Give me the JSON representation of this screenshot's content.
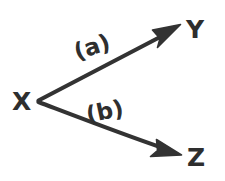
{
  "figure": {
    "kind": "hand-drawn-vector-diagram",
    "title": "",
    "background_color": "#ffffff",
    "ink_color": "#333333",
    "width": 225,
    "height": 181
  },
  "nodes": [
    {
      "id": "X",
      "label": "X",
      "x": 22,
      "y": 101,
      "role": "origin-vertex"
    },
    {
      "id": "Y",
      "label": "Y",
      "x": 195,
      "y": 29,
      "role": "upper-target"
    },
    {
      "id": "Z",
      "label": "Z",
      "x": 196,
      "y": 157,
      "role": "lower-target"
    }
  ],
  "edges": [
    {
      "id": "edge-a",
      "label": "(a)",
      "from": "X",
      "to": "Y",
      "start": {
        "x": 38,
        "y": 100
      },
      "end": {
        "x": 178,
        "y": 27
      },
      "arrowhead": "filled-triangle",
      "label_pos": {
        "x": 77,
        "y": 60
      },
      "label_rotation": -18
    },
    {
      "id": "edge-b",
      "label": "(b)",
      "from": "X",
      "to": "Z",
      "start": {
        "x": 38,
        "y": 102
      },
      "end": {
        "x": 179,
        "y": 153
      },
      "arrowhead": "filled-triangle",
      "label_pos": {
        "x": 88,
        "y": 123
      },
      "label_rotation": -12
    }
  ],
  "accessibility": {
    "description": "Point X with two arrows branching to the right: an upper arrow labeled (a) pointing to Y, and a lower arrow labeled (b) pointing to Z."
  }
}
